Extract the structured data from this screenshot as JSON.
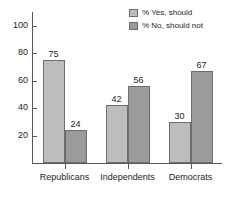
{
  "chart_data": {
    "type": "bar",
    "title": "",
    "subtitle": "",
    "xlabel": "",
    "ylabel": "",
    "categories": [
      "Republicans",
      "Independents",
      "Democrats"
    ],
    "series": [
      {
        "name": "% Yes, should",
        "values": [
          75,
          42,
          30
        ],
        "color": "#bdbdbd"
      },
      {
        "name": "% No, should not",
        "values": [
          24,
          56,
          67
        ],
        "color": "#9b9b9b"
      }
    ],
    "ylim": [
      0,
      110
    ],
    "yticks": [
      20,
      40,
      60,
      80,
      100
    ],
    "ytick_labels": [
      "20",
      "40",
      "60",
      "80",
      "100"
    ],
    "grid": false,
    "legend_position": "top-right",
    "data_labels": true
  },
  "legend": {
    "entries": [
      {
        "label": "% Yes, should"
      },
      {
        "label": "% No, should not"
      }
    ]
  }
}
